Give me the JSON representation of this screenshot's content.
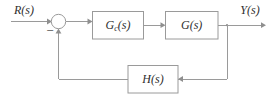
{
  "diagram": {
    "type": "control-system-block-diagram",
    "background_color": "#ffffff",
    "line_color": "#9a9a9a",
    "text_color": "#2f2f2f",
    "signals": {
      "input_label": "R(s)",
      "output_label": "Y(s)"
    },
    "summing_junction": {
      "name": "summing-junction",
      "positive_input": "R(s)",
      "negative_input": "H(s) feedback",
      "sign_negative": "−",
      "sign_positive_hidden": "+"
    },
    "blocks": [
      {
        "id": "controller",
        "label_main": "G",
        "label_sub": "c",
        "label_tail": "(s)",
        "label_full": "G_c(s)"
      },
      {
        "id": "plant",
        "label_main": "G",
        "label_sub": "",
        "label_tail": "(s)",
        "label_full": "G(s)"
      },
      {
        "id": "feedback",
        "label_main": "H",
        "label_sub": "",
        "label_tail": "(s)",
        "label_full": "H(s)"
      }
    ],
    "connections": [
      "R(s) → summing junction (+)",
      "summing junction → G_c(s)",
      "G_c(s) → G(s)",
      "G(s) → Y(s)",
      "G(s) output takeoff → H(s)",
      "H(s) → summing junction (−)"
    ]
  }
}
